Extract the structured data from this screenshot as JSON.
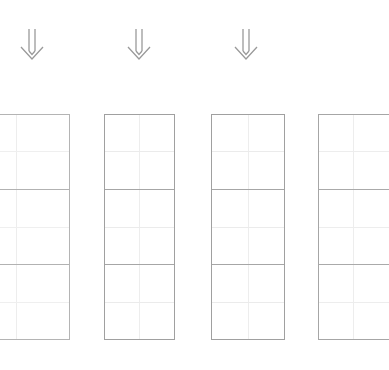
{
  "page": {
    "background_color": "#ffffff",
    "width": 337,
    "height": 370
  },
  "arrows": {
    "glyph": "double-down-arrow",
    "symbol": "⇓",
    "color": "#9a9a9a",
    "count": 3,
    "items": [
      {
        "id": "arrow-1",
        "center_x": 32,
        "top": 28,
        "label": "⇓"
      },
      {
        "id": "arrow-2",
        "center_x": 139,
        "top": 28,
        "label": "⇓"
      },
      {
        "id": "arrow-3",
        "center_x": 246,
        "top": 28,
        "label": "⇓"
      }
    ]
  },
  "grids": {
    "columns": 2,
    "rows": 6,
    "top": 114,
    "height": 226,
    "row_height": 37.6,
    "border_color": "#9e9e9e",
    "major_line_color": "#a8a8a8",
    "minor_line_color": "#ebebeb",
    "column_line_color": "#ededed",
    "major_row_interval": 2,
    "tables": [
      {
        "id": "grid-table-1",
        "left": -38,
        "width": 108,
        "clipped": "left",
        "border_color": "#b4b4b4",
        "major_line_color": "#b2b2b2",
        "minor_line_color": "#efefef"
      },
      {
        "id": "grid-table-2",
        "left": 104,
        "width": 71,
        "clipped": "none",
        "border_color": "#a0a0a0",
        "major_line_color": "#a6a6a6",
        "minor_line_color": "#ebebeb"
      },
      {
        "id": "grid-table-3",
        "left": 211,
        "width": 74,
        "clipped": "none",
        "border_color": "#a0a0a0",
        "major_line_color": "#a6a6a6",
        "minor_line_color": "#ebebeb"
      },
      {
        "id": "grid-table-4",
        "left": 318,
        "width": 71,
        "clipped": "right",
        "border_color": "#a6a6a6",
        "major_line_color": "#aaaaaa",
        "minor_line_color": "#ededed"
      }
    ]
  }
}
